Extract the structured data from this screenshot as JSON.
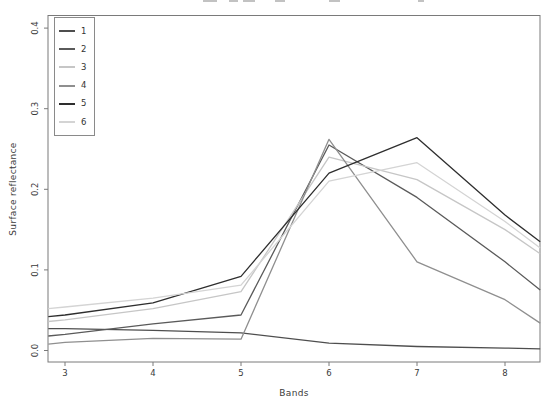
{
  "figure": {
    "xlabel": "Bands",
    "ylabel": "Surface reflectance"
  },
  "clipped_title_marks": [
    {
      "x": 203,
      "w": 14
    },
    {
      "x": 229,
      "w": 9
    },
    {
      "x": 243,
      "w": 12
    },
    {
      "x": 275,
      "w": 10
    },
    {
      "x": 329,
      "w": 11
    },
    {
      "x": 418,
      "w": 6
    }
  ],
  "chart_data": {
    "type": "line",
    "title": "",
    "xlabel": "Bands",
    "ylabel": "Surface reflectance",
    "x_ticks": [
      "3",
      "4",
      "5",
      "6",
      "7",
      "8"
    ],
    "y_ticks": [
      "0.0",
      "0.1",
      "0.2",
      "0.3",
      "0.4"
    ],
    "xlim": [
      2.81,
      8.4
    ],
    "ylim": [
      -0.014,
      0.415
    ],
    "grid": false,
    "legend_position": "top-left",
    "frame_color": "#7a7a7a",
    "x": [
      2.81,
      3,
      4,
      5,
      6,
      7,
      8,
      8.4
    ],
    "series": [
      {
        "name": "1",
        "color": "#4e4e4e",
        "values": [
          0.027,
          0.027,
          0.025,
          0.022,
          0.009,
          0.005,
          0.003,
          0.002
        ]
      },
      {
        "name": "2",
        "color": "#5a5a5a",
        "values": [
          0.018,
          0.02,
          0.033,
          0.044,
          0.255,
          0.19,
          0.11,
          0.075
        ]
      },
      {
        "name": "3",
        "color": "#c6c6c6",
        "values": [
          0.036,
          0.038,
          0.052,
          0.073,
          0.24,
          0.212,
          0.15,
          0.12
        ]
      },
      {
        "name": "4",
        "color": "#8f8f8f",
        "values": [
          0.008,
          0.01,
          0.015,
          0.014,
          0.262,
          0.11,
          0.063,
          0.034
        ]
      },
      {
        "name": "5",
        "color": "#2e2e2e",
        "values": [
          0.042,
          0.044,
          0.059,
          0.092,
          0.22,
          0.264,
          0.168,
          0.135
        ]
      },
      {
        "name": "6",
        "color": "#d4d4d4",
        "values": [
          0.052,
          0.054,
          0.065,
          0.081,
          0.21,
          0.233,
          0.16,
          0.127
        ]
      }
    ]
  }
}
